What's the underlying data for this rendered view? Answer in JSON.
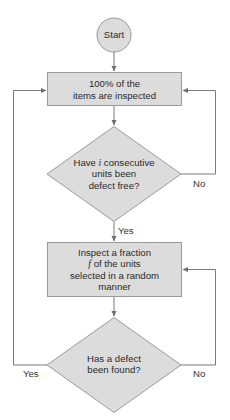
{
  "diagram": {
    "type": "flowchart",
    "colors": {
      "fill": "#dcdcdc",
      "border": "#9a9a9a",
      "line": "#7a7a7a",
      "text": "#2a2a2a"
    },
    "nodes": {
      "start": {
        "shape": "circle",
        "label": "Start"
      },
      "full_inspection": {
        "shape": "rectangle",
        "lines": [
          "100% of the",
          "items are inspected"
        ]
      },
      "consecutive_check": {
        "shape": "diamond",
        "line1_pre": "Have ",
        "line1_var": "i",
        "line1_post": " consecutive",
        "line2": "units been",
        "line3": "defect free?"
      },
      "fraction_inspection": {
        "shape": "rectangle",
        "line1": "Inspect a fraction",
        "line2_var": "f",
        "line2_post": " of the units",
        "line3": "selected in a random",
        "line4": "manner"
      },
      "defect_check": {
        "shape": "diamond",
        "lines": [
          "Has a defect",
          "been found?"
        ]
      }
    },
    "edges": [
      {
        "from": "start",
        "to": "full_inspection",
        "label": ""
      },
      {
        "from": "full_inspection",
        "to": "consecutive_check",
        "label": ""
      },
      {
        "from": "consecutive_check",
        "to": "full_inspection",
        "label": "No"
      },
      {
        "from": "consecutive_check",
        "to": "fraction_inspection",
        "label": "Yes"
      },
      {
        "from": "fraction_inspection",
        "to": "defect_check",
        "label": ""
      },
      {
        "from": "defect_check",
        "to": "fraction_inspection",
        "label": "No"
      },
      {
        "from": "defect_check",
        "to": "full_inspection",
        "label": "Yes"
      }
    ],
    "edge_labels": {
      "consecutive_no": "No",
      "consecutive_yes": "Yes",
      "defect_no": "No",
      "defect_yes": "Yes"
    }
  }
}
